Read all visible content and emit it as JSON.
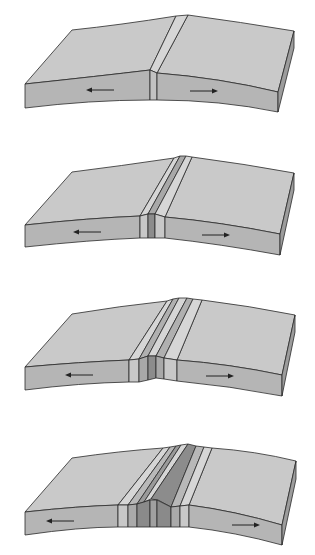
{
  "diagram": {
    "title": "",
    "colors": {
      "surface": "#c9c9c9",
      "front_face": "#b5b5b5",
      "side_face": "#9c9c9c",
      "outline": "#2a2a2a",
      "stripe_light": "#d6d6d6",
      "stripe_mid": "#b0b0b0",
      "stripe_dark": "#8c8c8c",
      "arrow": "#222222"
    },
    "stages": [
      {
        "label": "stage-1",
        "stripe_count": 1,
        "left_arrow": "left",
        "right_arrow": "right"
      },
      {
        "label": "stage-2",
        "stripe_count": 3,
        "left_arrow": "left",
        "right_arrow": "right"
      },
      {
        "label": "stage-3",
        "stripe_count": 5,
        "left_arrow": "left",
        "right_arrow": "right"
      },
      {
        "label": "stage-4",
        "stripe_count": 7,
        "left_arrow": "left",
        "right_arrow": "right"
      }
    ]
  }
}
